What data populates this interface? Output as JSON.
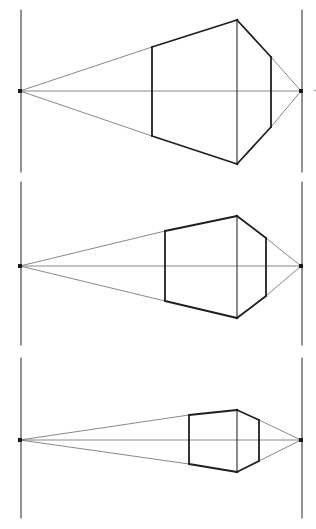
{
  "diagram": {
    "colors": {
      "ink": "#1f1f1f",
      "construction": "#6a6a6a",
      "paper": "#ffffff"
    },
    "figures": [
      {
        "id": "figure-1",
        "label": "Box close to viewer",
        "near_edge_height": 1.0,
        "left_face_ratio": 0.62,
        "right_face_ratio": 0.49
      },
      {
        "id": "figure-2",
        "label": "Box at middle distance",
        "near_edge_height": 0.71,
        "left_face_ratio": 0.49,
        "right_face_ratio": 0.57
      },
      {
        "id": "figure-3",
        "label": "Box far from viewer",
        "near_edge_height": 0.43,
        "left_face_ratio": 0.79,
        "right_face_ratio": 0.66
      }
    ]
  }
}
